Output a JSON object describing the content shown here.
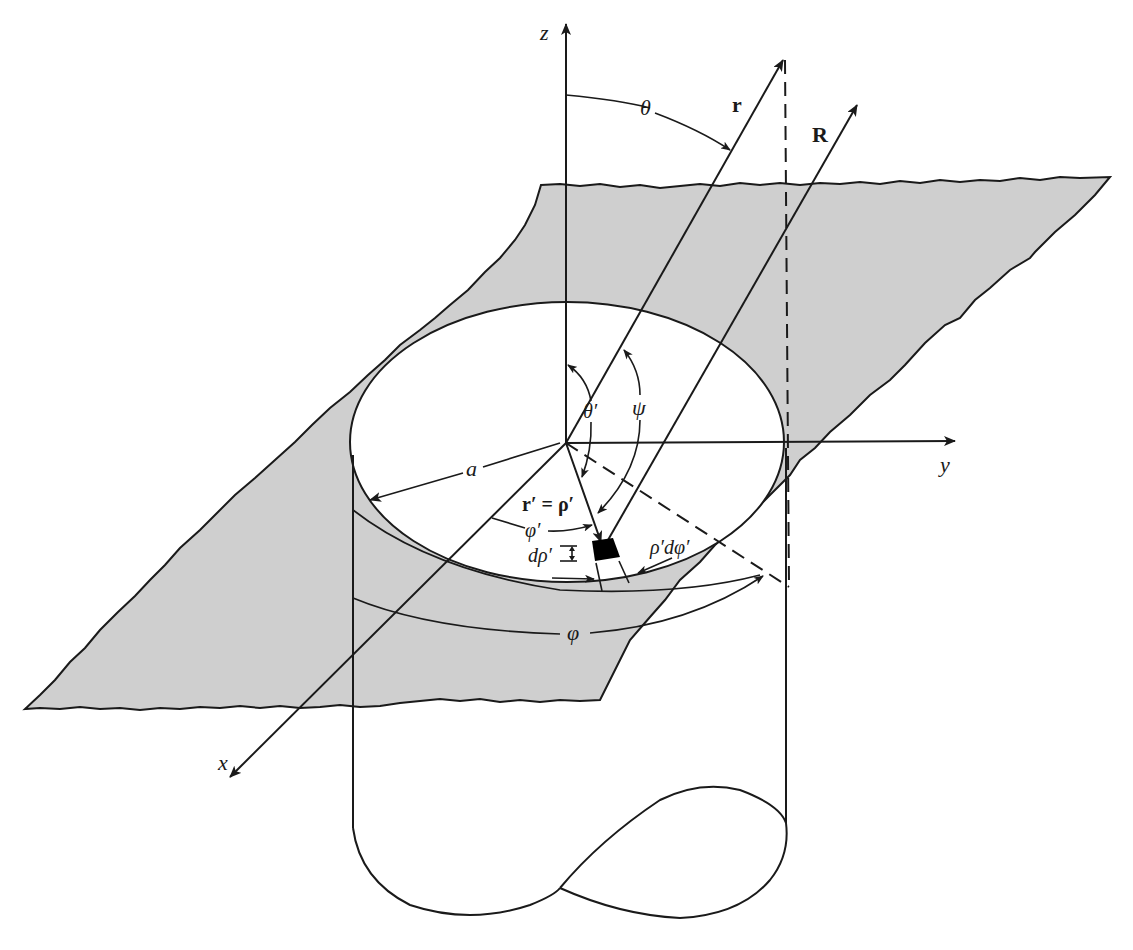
{
  "figure": {
    "colors": {
      "plane": "#cfcfcf",
      "line": "#1a1a1a",
      "background": "#ffffff",
      "element": "#000000"
    }
  },
  "axes": {
    "z": "z",
    "y": "y",
    "x": "x"
  },
  "vectors": {
    "r": "r",
    "R": "R",
    "r_prime": "r′ = ρ′"
  },
  "angles": {
    "theta": "θ",
    "theta_prime": "θ′",
    "psi": "ψ",
    "phi": "φ",
    "phi_prime": "φ′"
  },
  "dimensions": {
    "radius": "a",
    "d_rho": "dρ′",
    "rho_d_phi": "ρ′dφ′"
  }
}
